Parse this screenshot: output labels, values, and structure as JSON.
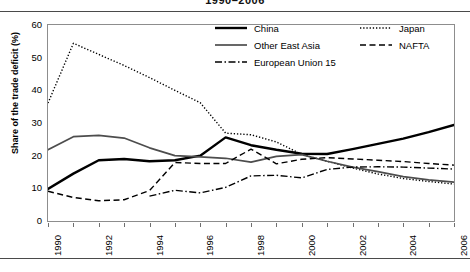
{
  "title_partial": "1990–2006",
  "axes": {
    "ylabel": "Share of the trade deficit (%)",
    "yticks": [
      "0",
      "10",
      "20",
      "30",
      "40",
      "50",
      "60"
    ],
    "xticks": [
      "1990",
      "1992",
      "1994",
      "1996",
      "1998",
      "2000",
      "2002",
      "2004",
      "2006"
    ]
  },
  "legend": {
    "items": [
      {
        "label": "China",
        "style": "solid-thick",
        "color": "#000000"
      },
      {
        "label": "Japan",
        "style": "dotted",
        "color": "#000000"
      },
      {
        "label": "Other East Asia",
        "style": "solid-medium",
        "color": "#4d4d4d"
      },
      {
        "label": "NAFTA",
        "style": "dashed",
        "color": "#000000"
      },
      {
        "label": "European Union 15",
        "style": "dash-dot",
        "color": "#000000"
      }
    ]
  },
  "chart_data": {
    "type": "line",
    "title": "1990–2006",
    "xlabel": "",
    "ylabel": "Share of the trade deficit (%)",
    "xlim": [
      1990,
      2006
    ],
    "ylim": [
      0,
      60
    ],
    "grid": false,
    "legend_position": "top-right",
    "x": [
      1990,
      1991,
      1992,
      1993,
      1994,
      1995,
      1996,
      1997,
      1998,
      1999,
      2000,
      2001,
      2002,
      2003,
      2004,
      2005,
      2006
    ],
    "series": [
      {
        "name": "China",
        "style": "solid-thick",
        "color": "#000000",
        "values": [
          9.8,
          14.5,
          18.6,
          19.0,
          18.3,
          18.6,
          20.0,
          25.6,
          23.2,
          21.8,
          20.6,
          20.5,
          22.0,
          23.6,
          25.2,
          27.2,
          29.4
        ]
      },
      {
        "name": "Japan",
        "style": "dotted",
        "color": "#000000",
        "values": [
          36.1,
          54.4,
          51.0,
          47.6,
          43.9,
          40.0,
          36.2,
          26.9,
          26.4,
          24.2,
          20.4,
          18.3,
          16.2,
          14.4,
          13.0,
          12.1,
          11.3
        ]
      },
      {
        "name": "Other East Asia",
        "style": "solid-medium",
        "color": "#4d4d4d",
        "values": [
          21.8,
          25.8,
          26.2,
          25.4,
          22.4,
          20.0,
          19.6,
          19.2,
          18.0,
          19.8,
          20.3,
          18.3,
          16.5,
          15.1,
          13.6,
          12.6,
          11.9
        ]
      },
      {
        "name": "NAFTA",
        "style": "dashed",
        "color": "#000000",
        "values": [
          9.1,
          7.2,
          6.2,
          6.5,
          9.3,
          17.9,
          17.6,
          17.6,
          22.0,
          17.5,
          18.9,
          19.4,
          19.0,
          18.6,
          18.2,
          17.6,
          17.1
        ]
      },
      {
        "name": "European Union 15",
        "style": "dash-dot",
        "color": "#000000",
        "values": [
          null,
          null,
          null,
          null,
          7.6,
          9.4,
          8.6,
          10.3,
          13.8,
          14.0,
          13.2,
          15.8,
          16.5,
          16.6,
          16.5,
          16.2,
          15.9
        ]
      }
    ]
  }
}
